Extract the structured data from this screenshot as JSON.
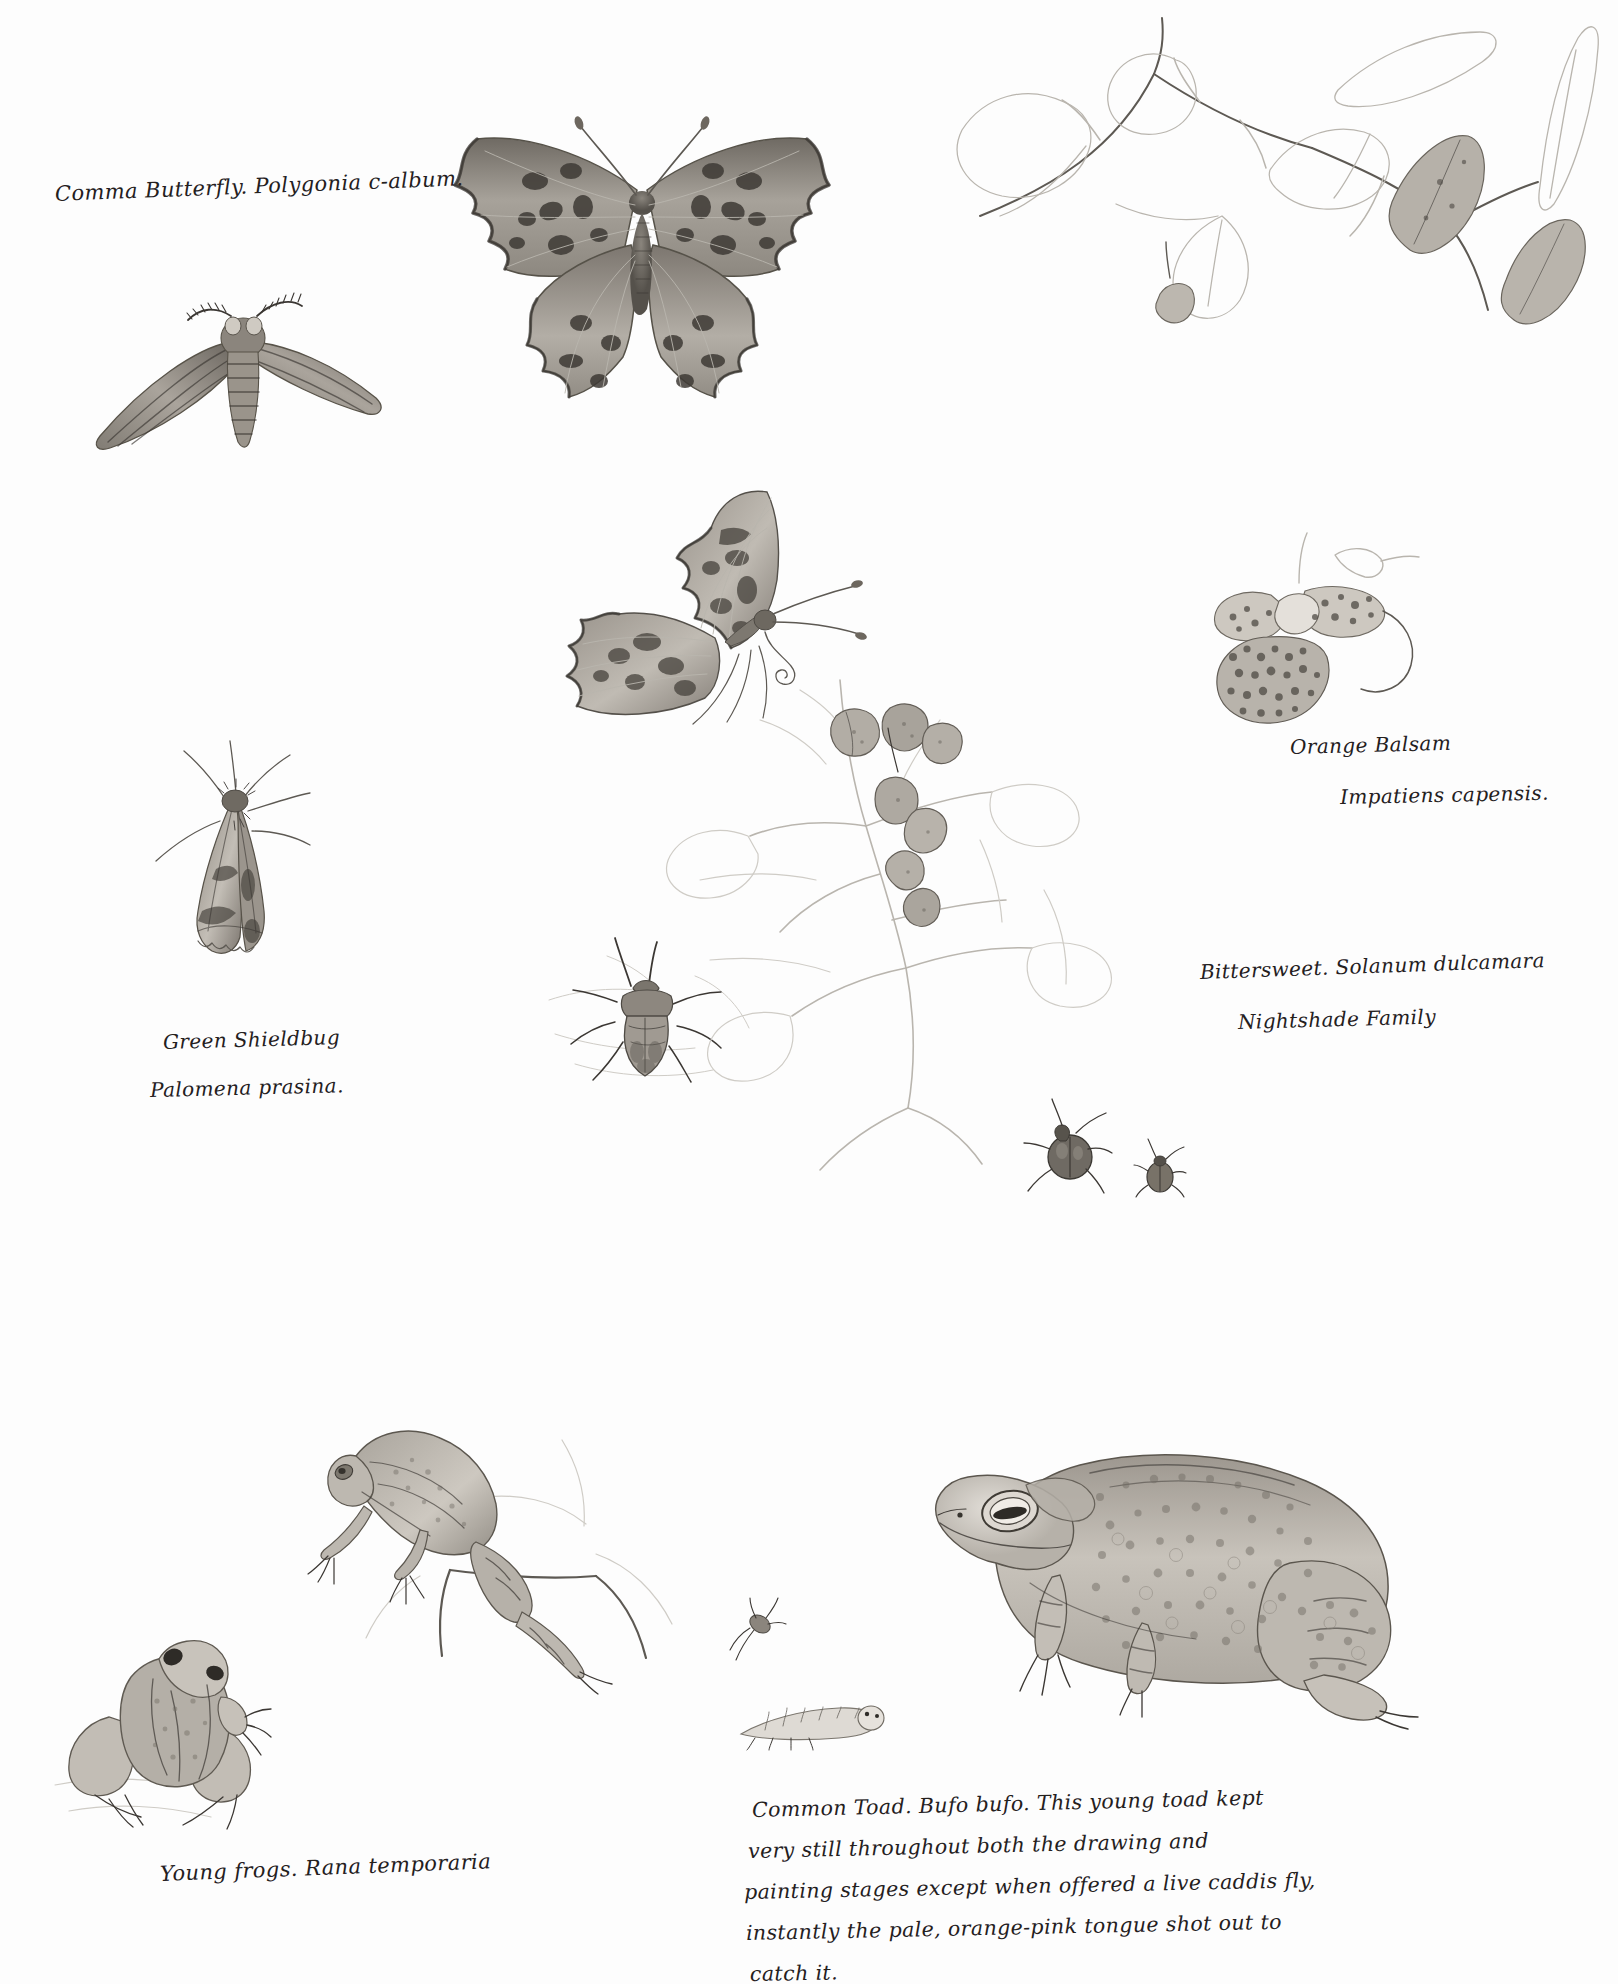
{
  "page": {
    "medium": "graphite pencil field sketches on white sketchbook paper",
    "background_color": "#fdfdfd",
    "ink_color": "#24201d",
    "pencil_color": "#5d5953"
  },
  "captions": {
    "comma_butterfly": "Comma Butterfly. Polygonia c-album.",
    "orange_balsam_line1": "Orange Balsam",
    "orange_balsam_line2": "Impatiens capensis.",
    "bittersweet_line1": "Bittersweet. Solanum dulcamara",
    "bittersweet_line2": "Nightshade Family",
    "shieldbug_line1": "Green Shieldbug",
    "shieldbug_line2": "Palomena prasina.",
    "young_frogs": "Young frogs. Rana temporaria",
    "toad_note_line1": "Common Toad. Bufo bufo. This young toad kept",
    "toad_note_line2": "very still throughout both the drawing and",
    "toad_note_line3": "painting stages except when offered a live caddis fly,",
    "toad_note_line4": "instantly the pale, orange-pink tongue shot out to",
    "toad_note_line5": "catch it."
  },
  "subjects": [
    {
      "id": "comma-butterfly-dorsal",
      "name": "Comma butterfly, wings spread from above",
      "species": "Polygonia c-album"
    },
    {
      "id": "hawk-moth",
      "name": "Hawk-moth with swept wings and feathered antennae",
      "species": ""
    },
    {
      "id": "comma-butterfly-lateral",
      "name": "Comma butterfly, side view with folded wings",
      "species": "Polygonia c-album"
    },
    {
      "id": "resting-moth",
      "name": "Small moth at rest with splayed legs",
      "species": ""
    },
    {
      "id": "green-shieldbug",
      "name": "Green shieldbug from above",
      "species": "Palomena prasina"
    },
    {
      "id": "orange-balsam-sprig",
      "name": "Orange balsam leafy stem, partly outlined",
      "species": "Impatiens capensis"
    },
    {
      "id": "orange-balsam-flower",
      "name": "Orange balsam flower with spotted throat and curved spur",
      "species": "Impatiens capensis"
    },
    {
      "id": "bittersweet-sprig",
      "name": "Bittersweet nightshade trailing stem with berries and buds",
      "species": "Solanum dulcamara"
    },
    {
      "id": "bittersweet-beetles",
      "name": "Two small beetles on the bittersweet stem",
      "species": ""
    },
    {
      "id": "climbing-frog",
      "name": "Young frog climbing a stem",
      "species": "Rana temporaria"
    },
    {
      "id": "sitting-frog",
      "name": "Young frog seen from behind",
      "species": "Rana temporaria"
    },
    {
      "id": "caddis-larva",
      "name": "Pale caddis fly larva",
      "species": ""
    },
    {
      "id": "small-insect",
      "name": "Small winged insect",
      "species": ""
    },
    {
      "id": "common-toad",
      "name": "Young common toad in profile, warty stippled skin",
      "species": "Bufo bufo"
    }
  ]
}
